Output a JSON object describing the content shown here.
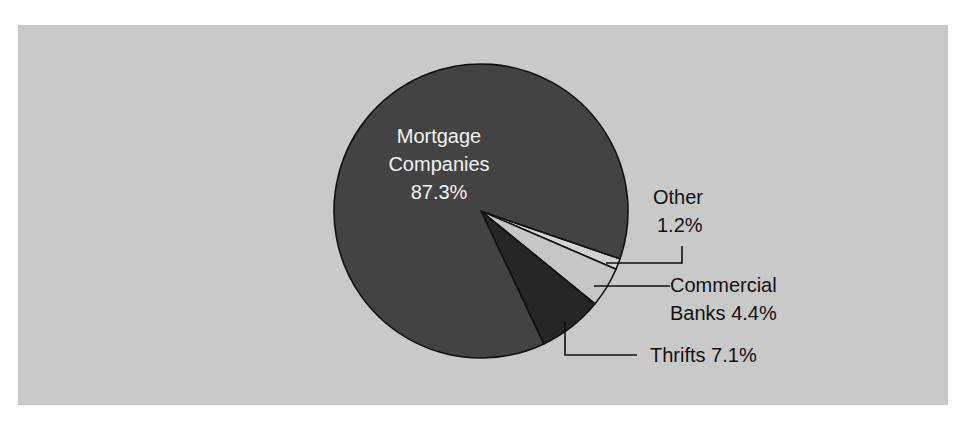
{
  "chart_data": {
    "type": "pie",
    "title": "",
    "categories": [
      "Mortgage Companies",
      "Other",
      "Commercial Banks",
      "Thrifts"
    ],
    "values": [
      87.3,
      1.2,
      4.4,
      7.1
    ],
    "unit": "%",
    "colors": {
      "Mortgage Companies": "#434343",
      "Other": "#d2d2d2",
      "Commercial Banks": "#c6c6c6",
      "Thrifts": "#262626"
    },
    "labels": {
      "mortgage": [
        "Mortgage",
        "Companies",
        "87.3%"
      ],
      "other": [
        "Other",
        "1.2%"
      ],
      "commercial": [
        "Commercial",
        "Banks 4.4%"
      ],
      "thrifts": [
        "Thrifts 7.1%"
      ]
    },
    "legend": "none (direct labels with leader lines)",
    "background": "#c9c9c9"
  }
}
